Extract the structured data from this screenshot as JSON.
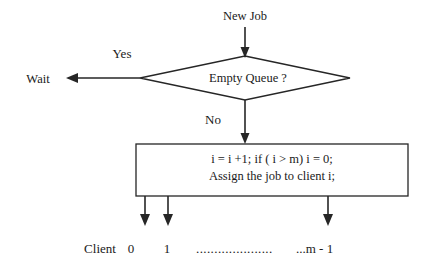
{
  "diagram": {
    "background_color": "#ffffff",
    "line_color": "#262626",
    "text_color": "#1a1a1a",
    "nodes": {
      "start": {
        "label": "New Job"
      },
      "decision": {
        "label": "Empty Queue ?"
      },
      "wait": {
        "label": "Wait"
      },
      "process": {
        "line1": "i = i +1;   if ( i > m) i = 0;",
        "line2": "Assign the job to client i;"
      }
    },
    "edges": {
      "yes": {
        "label": "Yes"
      },
      "no": {
        "label": "No"
      }
    },
    "legend": {
      "prefix": "Client",
      "first": "0",
      "second": "1",
      "dots": ".....................",
      "last": "...m - 1"
    }
  }
}
